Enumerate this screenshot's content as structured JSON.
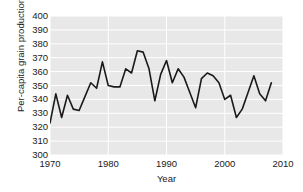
{
  "chart_data": {
    "type": "line",
    "title": "",
    "xlabel": "Year",
    "ylabel": "Per-capita grain production (kg)",
    "xlim": [
      1970,
      2010
    ],
    "ylim": [
      300,
      400
    ],
    "xticks": [
      1970,
      1980,
      1990,
      2000,
      2010
    ],
    "yticks": [
      300,
      310,
      320,
      330,
      340,
      350,
      360,
      370,
      380,
      390,
      400
    ],
    "grid": true,
    "legend": "none",
    "plot_background": "#e8e8e8",
    "line_color": "#1a1a1a",
    "x": [
      1970,
      1971,
      1972,
      1973,
      1974,
      1975,
      1976,
      1977,
      1978,
      1979,
      1980,
      1981,
      1982,
      1983,
      1984,
      1985,
      1986,
      1987,
      1988,
      1989,
      1990,
      1991,
      1992,
      1993,
      1994,
      1995,
      1996,
      1997,
      1998,
      1999,
      2000,
      2001,
      2002,
      2003,
      2004,
      2005,
      2006,
      2007,
      2008
    ],
    "values": [
      323,
      344,
      327,
      343,
      333,
      332,
      342,
      352,
      348,
      367,
      350,
      349,
      349,
      362,
      359,
      375,
      374,
      362,
      339,
      358,
      368,
      352,
      362,
      356,
      345,
      334,
      355,
      359,
      357,
      352,
      340,
      343,
      327,
      333,
      345,
      357,
      344,
      339,
      352
    ],
    "series_name": "Per-capita grain production"
  },
  "axis": {
    "ytick_labels": [
      "400",
      "390",
      "380",
      "370",
      "360",
      "350",
      "340",
      "330",
      "320",
      "310",
      "300"
    ],
    "xtick_labels": [
      "1970",
      "1980",
      "1990",
      "2000",
      "2010"
    ]
  }
}
